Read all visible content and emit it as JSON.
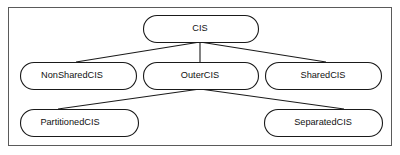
{
  "diagram": {
    "type": "hierarchy-tree",
    "frame": {
      "visible": true,
      "border_color": "#5a5a5a"
    },
    "node_style": {
      "shape": "rounded-rectangle",
      "fill_color": "#ffffff",
      "border_color": "#1a1a1a"
    },
    "edge_style": {
      "kind": "straight-line",
      "color": "#1a1a1a",
      "arrowheads": false
    },
    "nodes": [
      {
        "id": "cis",
        "label": "CIS",
        "level": 0,
        "x": 143,
        "y": 15,
        "w": 115,
        "h": 27,
        "text_anchor_x": 200,
        "text_align": "center"
      },
      {
        "id": "nonsharedcis",
        "label": "NonSharedCIS",
        "level": 1,
        "x": 20,
        "y": 62,
        "w": 116,
        "h": 27,
        "text_anchor_x": 72,
        "text_align": "center"
      },
      {
        "id": "outercis",
        "label": "OuterCIS",
        "level": 1,
        "x": 143,
        "y": 62,
        "w": 115,
        "h": 27,
        "text_anchor_x": 200,
        "text_align": "center"
      },
      {
        "id": "sharedcis",
        "label": "SharedCIS",
        "level": 1,
        "x": 265,
        "y": 62,
        "w": 116,
        "h": 27,
        "text_anchor_x": 323,
        "text_align": "center"
      },
      {
        "id": "partitionedcis",
        "label": "PartitionedCIS",
        "level": 2,
        "x": 20,
        "y": 109,
        "w": 118,
        "h": 27,
        "text_anchor_x": 70,
        "text_align": "center"
      },
      {
        "id": "separatedcis",
        "label": "SeparatedCIS",
        "level": 2,
        "x": 264,
        "y": 109,
        "w": 118,
        "h": 27,
        "text_anchor_x": 323,
        "text_align": "center"
      }
    ],
    "edges": [
      {
        "id": "cis-to-nonsharedcis",
        "from": "cis",
        "to": "nonsharedcis",
        "x1": 200,
        "y1": 42,
        "x2": 76,
        "y2": 62
      },
      {
        "id": "cis-to-outercis",
        "from": "cis",
        "to": "outercis",
        "x1": 200,
        "y1": 42,
        "x2": 200,
        "y2": 62
      },
      {
        "id": "cis-to-sharedcis",
        "from": "cis",
        "to": "sharedcis",
        "x1": 200,
        "y1": 42,
        "x2": 326,
        "y2": 62
      },
      {
        "id": "outercis-to-partitionedcis",
        "from": "outercis",
        "to": "partitionedcis",
        "x1": 200,
        "y1": 89,
        "x2": 58,
        "y2": 109
      },
      {
        "id": "outercis-to-separatedcis",
        "from": "outercis",
        "to": "separatedcis",
        "x1": 200,
        "y1": 89,
        "x2": 344,
        "y2": 109
      }
    ]
  }
}
